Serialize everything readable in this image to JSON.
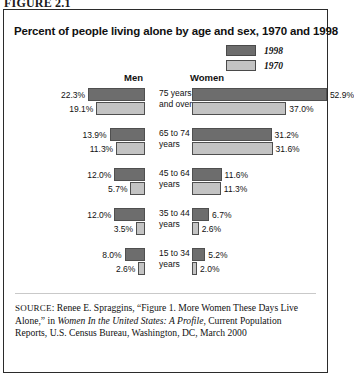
{
  "figure_label": "FIGURE 2.1",
  "panel": {
    "title": "Percent of people living alone by age and sex, 1970 and 1998",
    "legend": [
      {
        "label": "1998",
        "color": "#6d6d6d"
      },
      {
        "label": "1970",
        "color": "#c3c3c3"
      }
    ],
    "columns": {
      "left": "Men",
      "right": "Women"
    }
  },
  "source": {
    "prefix": "SOURCE",
    "text_1": ": Renee E. Spraggins, “Figure 1. More Women These Days Live Alone,” in ",
    "italic_1": "Women In the United States: A Profile",
    "text_2": ", Current Population Reports, U.S. Census Bureau, Washington, DC, March 2000"
  },
  "chart_data": {
    "type": "bar",
    "title": "Percent of people living alone by age and sex, 1970 and 1998",
    "subtype": "butterfly/diverging horizontal bar",
    "xlabel": "",
    "ylabel": "",
    "unit": "percent",
    "xlim": [
      0,
      55
    ],
    "grid": false,
    "legend_position": "top-right",
    "categories": [
      "75 years and over",
      "65 to 74 years",
      "45 to 64 years",
      "35 to 44 years",
      "15 to 34 years"
    ],
    "groups": [
      "Men",
      "Women"
    ],
    "series": [
      {
        "name": "Men 1998",
        "group": "Men",
        "year": "1998",
        "color": "#6d6d6d",
        "values": [
          22.3,
          13.9,
          12.0,
          12.0,
          8.0
        ]
      },
      {
        "name": "Men 1970",
        "group": "Men",
        "year": "1970",
        "color": "#c3c3c3",
        "values": [
          19.1,
          11.3,
          5.7,
          3.5,
          2.6
        ]
      },
      {
        "name": "Women 1998",
        "group": "Women",
        "year": "1998",
        "color": "#6d6d6d",
        "values": [
          52.9,
          31.2,
          11.6,
          6.7,
          5.2
        ]
      },
      {
        "name": "Women 1970",
        "group": "Women",
        "year": "1970",
        "color": "#c3c3c3",
        "values": [
          37.0,
          31.6,
          11.3,
          2.6,
          2.0
        ]
      }
    ],
    "rows": [
      {
        "category_line1": "75 years",
        "category_line2": "and over",
        "men": {
          "y1998": "22.3%",
          "y1970": "19.1%",
          "v1998": 22.3,
          "v1970": 19.1
        },
        "women": {
          "y1998": "52.9%",
          "y1970": "37.0%",
          "v1998": 52.9,
          "v1970": 37.0
        }
      },
      {
        "category_line1": "65 to 74",
        "category_line2": "years",
        "men": {
          "y1998": "13.9%",
          "y1970": "11.3%",
          "v1998": 13.9,
          "v1970": 11.3
        },
        "women": {
          "y1998": "31.2%",
          "y1970": "31.6%",
          "v1998": 31.2,
          "v1970": 31.6
        }
      },
      {
        "category_line1": "45 to 64",
        "category_line2": "years",
        "men": {
          "y1998": "12.0%",
          "y1970": "5.7%",
          "v1998": 12.0,
          "v1970": 5.7
        },
        "women": {
          "y1998": "11.6%",
          "y1970": "11.3%",
          "v1998": 11.6,
          "v1970": 11.3
        }
      },
      {
        "category_line1": "35 to 44",
        "category_line2": "years",
        "men": {
          "y1998": "12.0%",
          "y1970": "3.5%",
          "v1998": 12.0,
          "v1970": 3.5
        },
        "women": {
          "y1998": "6.7%",
          "y1970": "2.6%",
          "v1998": 6.7,
          "v1970": 2.6
        }
      },
      {
        "category_line1": "15 to 34",
        "category_line2": "years",
        "men": {
          "y1998": "8.0%",
          "y1970": "2.6%",
          "v1998": 8.0,
          "v1970": 2.6
        },
        "women": {
          "y1998": "5.2%",
          "y1970": "2.0%",
          "v1998": 5.2,
          "v1970": 2.0
        }
      }
    ]
  }
}
